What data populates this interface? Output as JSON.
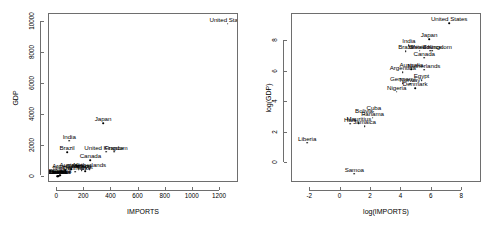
{
  "figure": {
    "width": 492,
    "height": 235,
    "background": "#ffffff",
    "foreground": "#000000",
    "frame_color": "#6e6e6e",
    "panel_count": 2
  },
  "chart_data": [
    {
      "type": "scatter",
      "title": "",
      "xlabel": "IMPORTS",
      "ylabel": "GDP",
      "xlim": [
        -60,
        1340
      ],
      "ylim": [
        -420,
        10500
      ],
      "xticks": [
        0,
        200,
        400,
        600,
        800,
        1000,
        1200
      ],
      "yticks": [
        0,
        2000,
        4000,
        6000,
        8000,
        10000
      ],
      "xticklabels": [
        "0",
        "200",
        "400",
        "600",
        "800",
        "1000",
        "1200"
      ],
      "yticklabels": [
        "0",
        "2000",
        "4000",
        "6000",
        "8000",
        "10000"
      ],
      "grid": false,
      "legend": null,
      "marker": "text-label",
      "points": [
        {
          "label": "United States",
          "x": 1257,
          "y": 9873
        },
        {
          "label": "Japan",
          "x": 338,
          "y": 3425
        },
        {
          "label": "India",
          "x": 89,
          "y": 2320
        },
        {
          "label": "Brazil",
          "x": 73,
          "y": 1570
        },
        {
          "label": "United Kingdom",
          "x": 360,
          "y": 1610
        },
        {
          "label": "France",
          "x": 420,
          "y": 1600
        },
        {
          "label": "Canada",
          "x": 245,
          "y": 1035
        },
        {
          "label": "Australia",
          "x": 105,
          "y": 480
        },
        {
          "label": "Netherlands",
          "x": 240,
          "y": 470
        },
        {
          "label": "Germany",
          "x": 160,
          "y": 430
        },
        {
          "label": "Egypt",
          "x": 205,
          "y": 350
        },
        {
          "label": "Argentina",
          "x": 60,
          "y": 390
        },
        {
          "label": "Nigeria",
          "x": 40,
          "y": 300
        },
        {
          "label": "Denmark",
          "x": 135,
          "y": 300
        },
        {
          "label": "Mexico",
          "x": 180,
          "y": 400
        },
        {
          "label": "Cuba",
          "x": 18,
          "y": 90
        },
        {
          "label": "Panama",
          "x": 22,
          "y": 80
        },
        {
          "label": "Bolivia",
          "x": 12,
          "y": 60
        },
        {
          "label": "Jamaica",
          "x": 14,
          "y": 45
        },
        {
          "label": "Mauritius",
          "x": 10,
          "y": 40
        },
        {
          "label": "Haiti",
          "x": 8,
          "y": 35
        },
        {
          "label": "Liberia",
          "x": 3,
          "y": 20
        },
        {
          "label": "Samoa",
          "x": 2,
          "y": 5
        }
      ]
    },
    {
      "type": "scatter",
      "title": "",
      "xlabel": "log(IMPORTS)",
      "ylabel": "log(GDP)",
      "xlim": [
        -3.2,
        9.3
      ],
      "ylim": [
        -1.3,
        9.8
      ],
      "xticks": [
        -2,
        0,
        2,
        4,
        6,
        8
      ],
      "yticks": [
        0,
        2,
        4,
        6,
        8
      ],
      "xticklabels": [
        "-2",
        "0",
        "2",
        "4",
        "6",
        "8"
      ],
      "yticklabels": [
        "0",
        "2",
        "4",
        "6",
        "8"
      ],
      "grid": false,
      "legend": null,
      "marker": "text-label",
      "points": [
        {
          "label": "United States",
          "x": 7.14,
          "y": 9.2
        },
        {
          "label": "Japan",
          "x": 5.82,
          "y": 8.14
        },
        {
          "label": "India",
          "x": 4.49,
          "y": 7.75
        },
        {
          "label": "United Kingdom",
          "x": 5.89,
          "y": 7.38
        },
        {
          "label": "Brazil",
          "x": 4.29,
          "y": 7.36
        },
        {
          "label": "France",
          "x": 6.04,
          "y": 7.38
        },
        {
          "label": "Mexico",
          "x": 5.2,
          "y": 7.38
        },
        {
          "label": "Canada",
          "x": 5.5,
          "y": 6.94
        },
        {
          "label": "Australia",
          "x": 4.65,
          "y": 6.17
        },
        {
          "label": "Netherlands",
          "x": 5.48,
          "y": 6.15
        },
        {
          "label": "Argentina",
          "x": 4.09,
          "y": 5.97
        },
        {
          "label": "Egypt",
          "x": 5.32,
          "y": 5.46
        },
        {
          "label": "Germany",
          "x": 4.08,
          "y": 5.26
        },
        {
          "label": "Norway",
          "x": 4.56,
          "y": 5.23
        },
        {
          "label": "Denmark",
          "x": 4.9,
          "y": 4.92
        },
        {
          "label": "Nigeria",
          "x": 3.69,
          "y": 4.7
        },
        {
          "label": "Cuba",
          "x": 2.18,
          "y": 3.38
        },
        {
          "label": "Bolivia",
          "x": 1.54,
          "y": 3.18
        },
        {
          "label": "Panama",
          "x": 2.1,
          "y": 3.0
        },
        {
          "label": "Mauritius",
          "x": 1.2,
          "y": 2.62
        },
        {
          "label": "Haiti",
          "x": 0.62,
          "y": 2.6
        },
        {
          "label": "Jamaica",
          "x": 1.58,
          "y": 2.42
        },
        {
          "label": "Liberia",
          "x": -2.2,
          "y": 1.35
        },
        {
          "label": "Samoa",
          "x": 0.9,
          "y": -0.68
        }
      ]
    }
  ]
}
